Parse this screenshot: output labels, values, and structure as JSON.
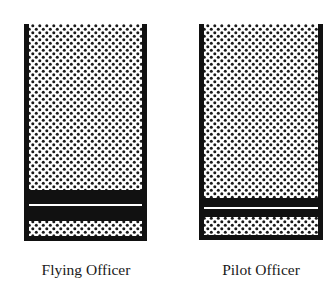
{
  "figure": {
    "insignias": [
      {
        "rank": "Flying Officer",
        "description": "Sleeve insignia: one medium black band with a thin white centre line dividing it into two black bands",
        "frame": {
          "x": 24,
          "y": 24,
          "width": 122,
          "height": 217
        },
        "bands": [
          {
            "type": "black",
            "y0": 190,
            "y1": 204
          },
          {
            "type": "white-line",
            "y0": 204,
            "y1": 206
          },
          {
            "type": "black",
            "y0": 206,
            "y1": 221
          },
          {
            "type": "dotted",
            "y0": 221,
            "y1": 236
          },
          {
            "type": "black",
            "y0": 236,
            "y1": 241
          }
        ]
      },
      {
        "rank": "Pilot Officer",
        "description": "Sleeve insignia: one narrow black band with a thin white centre line dividing it into two thin black bands",
        "frame": {
          "x": 199,
          "y": 24,
          "width": 123,
          "height": 216
        },
        "bands": [
          {
            "type": "black",
            "y0": 198,
            "y1": 207
          },
          {
            "type": "white-line",
            "y0": 207,
            "y1": 209
          },
          {
            "type": "black",
            "y0": 209,
            "y1": 217
          },
          {
            "type": "dotted",
            "y0": 217,
            "y1": 235
          },
          {
            "type": "black",
            "y0": 235,
            "y1": 240
          }
        ]
      }
    ],
    "labels": {
      "left": "Flying Officer",
      "right": "Pilot Officer"
    },
    "colors": {
      "ink": "#111111",
      "paper": "#ffffff",
      "dots": "#1a1a1a"
    }
  }
}
